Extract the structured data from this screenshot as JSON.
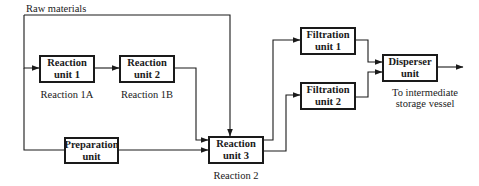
{
  "diagram": {
    "type": "process-flow",
    "input_label": "Raw materials",
    "units": [
      {
        "id": "reaction-unit-1",
        "name": "Reaction\nunit 1",
        "line1": "Reaction",
        "line2": "unit 1",
        "caption": "Reaction 1A"
      },
      {
        "id": "reaction-unit-2",
        "name": "Reaction\nunit 2",
        "line1": "Reaction",
        "line2": "unit 2",
        "caption": "Reaction 1B"
      },
      {
        "id": "preparation-unit",
        "line1": "Preparation",
        "line2": "unit",
        "caption": ""
      },
      {
        "id": "reaction-unit-3",
        "line1": "Reaction",
        "line2": "unit 3",
        "caption": "Reaction 2"
      },
      {
        "id": "filtration-unit-1",
        "line1": "Filtration",
        "line2": "unit 1",
        "caption": ""
      },
      {
        "id": "filtration-unit-2",
        "line1": "Filtration",
        "line2": "unit 2",
        "caption": ""
      },
      {
        "id": "disperser-unit",
        "line1": "Disperser",
        "line2": "unit",
        "caption": ""
      }
    ],
    "output_label_line1": "To intermediate",
    "output_label_line2": "storage vessel",
    "edges": [
      {
        "from": "raw-materials",
        "to": "reaction-unit-1"
      },
      {
        "from": "raw-materials",
        "to": "preparation-unit"
      },
      {
        "from": "raw-materials",
        "to": "reaction-unit-3"
      },
      {
        "from": "reaction-unit-1",
        "to": "reaction-unit-2"
      },
      {
        "from": "reaction-unit-2",
        "to": "reaction-unit-3"
      },
      {
        "from": "preparation-unit",
        "to": "reaction-unit-3"
      },
      {
        "from": "reaction-unit-3",
        "to": "filtration-unit-1"
      },
      {
        "from": "reaction-unit-3",
        "to": "filtration-unit-2"
      },
      {
        "from": "filtration-unit-1",
        "to": "disperser-unit"
      },
      {
        "from": "filtration-unit-2",
        "to": "disperser-unit"
      },
      {
        "from": "disperser-unit",
        "to": "intermediate-storage-vessel"
      }
    ]
  }
}
